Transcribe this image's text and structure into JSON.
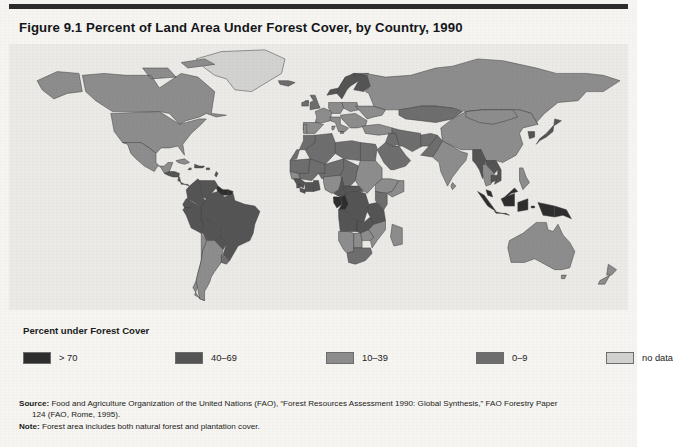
{
  "figure": {
    "title": "Figure 9.1  Percent of Land Area Under Forest Cover, by Country, 1990",
    "background_color": "#f6f5f2",
    "rule_color": "#2c2c2c"
  },
  "legend": {
    "title": "Percent under Forest Cover",
    "items": [
      {
        "label": "> 70",
        "color": "#2e2e2e",
        "x": 0
      },
      {
        "label": "40–69",
        "color": "#555555",
        "x": 152
      },
      {
        "label": "10–39",
        "color": "#8d8d8d",
        "x": 303
      },
      {
        "label": "0–9",
        "color": "#6e6e6e",
        "x": 453
      },
      {
        "label": "no data",
        "color": "#d2d2d0",
        "x": 583
      }
    ]
  },
  "notes": {
    "source_label": "Source:",
    "source_text": " Food and Agriculture Organization of the United Nations (FAO), “Forest Resources Assessment 1990: Global Synthesis,” FAO Forestry Paper",
    "source_cont": "124 (FAO, Rome, 1995).",
    "note_label": "Note:",
    "note_text": " Forest area includes both natural forest and plantation cover."
  },
  "chart_data": {
    "type": "map",
    "map_kind": "choropleth",
    "title": "Percent of Land Area Under Forest Cover, by Country, 1990",
    "unit": "percent of land area",
    "year": 1990,
    "projection": "equirectangular-ish world",
    "classes": [
      {
        "label": "> 70",
        "range": [
          70,
          100
        ],
        "color": "#2e2e2e"
      },
      {
        "label": "40–69",
        "range": [
          40,
          69
        ],
        "color": "#555555"
      },
      {
        "label": "10–39",
        "range": [
          10,
          39
        ],
        "color": "#8d8d8d"
      },
      {
        "label": "0–9",
        "range": [
          0,
          9
        ],
        "color": "#6e6e6e"
      },
      {
        "label": "no data",
        "range": null,
        "color": "#d2d2d0"
      }
    ],
    "ocean_color": "#eceae6",
    "border_color": "#3f3f3f",
    "regions": [
      {
        "name": "Greenland",
        "class": "no data"
      },
      {
        "name": "Canada",
        "class": "10–39"
      },
      {
        "name": "Alaska (United States)",
        "class": "10–39"
      },
      {
        "name": "United States",
        "class": "10–39"
      },
      {
        "name": "Mexico",
        "class": "10–39"
      },
      {
        "name": "Central America",
        "class": "40–69"
      },
      {
        "name": "Cuba",
        "class": "10–39"
      },
      {
        "name": "Caribbean islands",
        "class": "40–69"
      },
      {
        "name": "Colombia",
        "class": "40–69"
      },
      {
        "name": "Venezuela",
        "class": "40–69"
      },
      {
        "name": "Guyana",
        "class": "> 70"
      },
      {
        "name": "Suriname",
        "class": "> 70"
      },
      {
        "name": "French Guiana",
        "class": "> 70"
      },
      {
        "name": "Ecuador",
        "class": "40–69"
      },
      {
        "name": "Peru",
        "class": "40–69"
      },
      {
        "name": "Brazil",
        "class": "40–69"
      },
      {
        "name": "Bolivia",
        "class": "40–69"
      },
      {
        "name": "Paraguay",
        "class": "40–69"
      },
      {
        "name": "Chile",
        "class": "10–39"
      },
      {
        "name": "Argentina",
        "class": "10–39"
      },
      {
        "name": "Uruguay",
        "class": "0–9"
      },
      {
        "name": "Iceland",
        "class": "0–9"
      },
      {
        "name": "Norway",
        "class": "40–69"
      },
      {
        "name": "Sweden",
        "class": "40–69"
      },
      {
        "name": "Finland",
        "class": "40–69"
      },
      {
        "name": "United Kingdom",
        "class": "0–9"
      },
      {
        "name": "Ireland",
        "class": "0–9"
      },
      {
        "name": "France",
        "class": "10–39"
      },
      {
        "name": "Spain",
        "class": "10–39"
      },
      {
        "name": "Portugal",
        "class": "10–39"
      },
      {
        "name": "Germany",
        "class": "10–39"
      },
      {
        "name": "Poland",
        "class": "10–39"
      },
      {
        "name": "Italy",
        "class": "10–39"
      },
      {
        "name": "Balkans",
        "class": "10–39"
      },
      {
        "name": "Ukraine",
        "class": "10–39"
      },
      {
        "name": "Russian Federation",
        "class": "10–39"
      },
      {
        "name": "Kazakhstan",
        "class": "0–9"
      },
      {
        "name": "Turkey",
        "class": "10–39"
      },
      {
        "name": "Iran",
        "class": "0–9"
      },
      {
        "name": "Iraq",
        "class": "0–9"
      },
      {
        "name": "Saudi Arabia",
        "class": "0–9"
      },
      {
        "name": "Egypt",
        "class": "0–9"
      },
      {
        "name": "Libya",
        "class": "0–9"
      },
      {
        "name": "Algeria",
        "class": "0–9"
      },
      {
        "name": "Morocco",
        "class": "0–9"
      },
      {
        "name": "Mauritania",
        "class": "0–9"
      },
      {
        "name": "Mali",
        "class": "0–9"
      },
      {
        "name": "Niger",
        "class": "0–9"
      },
      {
        "name": "Chad",
        "class": "0–9"
      },
      {
        "name": "Sudan",
        "class": "10–39"
      },
      {
        "name": "Ethiopia",
        "class": "10–39"
      },
      {
        "name": "Somalia",
        "class": "10–39"
      },
      {
        "name": "Senegal",
        "class": "10–39"
      },
      {
        "name": "Guinea",
        "class": "40–69"
      },
      {
        "name": "Sierra Leone",
        "class": "40–69"
      },
      {
        "name": "Liberia",
        "class": "40–69"
      },
      {
        "name": "Côte d'Ivoire",
        "class": "40–69"
      },
      {
        "name": "Ghana",
        "class": "40–69"
      },
      {
        "name": "Nigeria",
        "class": "10–39"
      },
      {
        "name": "Cameroon",
        "class": "40–69"
      },
      {
        "name": "Equatorial Guinea",
        "class": "> 70"
      },
      {
        "name": "Gabon",
        "class": "> 70"
      },
      {
        "name": "Congo",
        "class": "> 70"
      },
      {
        "name": "Democratic Republic of the Congo",
        "class": "40–69"
      },
      {
        "name": "Central African Republic",
        "class": "40–69"
      },
      {
        "name": "Angola",
        "class": "40–69"
      },
      {
        "name": "Zambia",
        "class": "40–69"
      },
      {
        "name": "Zimbabwe",
        "class": "10–39"
      },
      {
        "name": "Mozambique",
        "class": "10–39"
      },
      {
        "name": "Tanzania",
        "class": "40–69"
      },
      {
        "name": "Kenya",
        "class": "0–9"
      },
      {
        "name": "Namibia",
        "class": "10–39"
      },
      {
        "name": "Botswana",
        "class": "10–39"
      },
      {
        "name": "South Africa",
        "class": "0–9"
      },
      {
        "name": "Madagascar",
        "class": "10–39"
      },
      {
        "name": "India",
        "class": "10–39"
      },
      {
        "name": "Pakistan",
        "class": "0–9"
      },
      {
        "name": "Afghanistan",
        "class": "0–9"
      },
      {
        "name": "China",
        "class": "10–39"
      },
      {
        "name": "Mongolia",
        "class": "10–39"
      },
      {
        "name": "Japan",
        "class": "40–69"
      },
      {
        "name": "Korea",
        "class": "40–69"
      },
      {
        "name": "Myanmar",
        "class": "40–69"
      },
      {
        "name": "Thailand",
        "class": "10–39"
      },
      {
        "name": "Laos",
        "class": "40–69"
      },
      {
        "name": "Viet Nam",
        "class": "40–69"
      },
      {
        "name": "Cambodia",
        "class": "40–69"
      },
      {
        "name": "Malaysia",
        "class": "> 70"
      },
      {
        "name": "Indonesia",
        "class": "> 70"
      },
      {
        "name": "Philippines",
        "class": "10–39"
      },
      {
        "name": "Papua New Guinea",
        "class": "> 70"
      },
      {
        "name": "Australia",
        "class": "10–39"
      },
      {
        "name": "New Zealand",
        "class": "10–39"
      },
      {
        "name": "Sri Lanka",
        "class": "10–39"
      }
    ]
  }
}
